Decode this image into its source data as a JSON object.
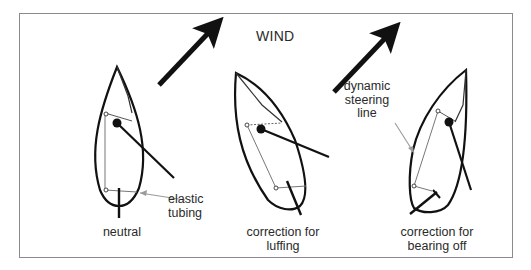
{
  "title": "WIND",
  "colors": {
    "stroke": "#111111",
    "thin_line": "#666666",
    "pointer": "#9a9a9a",
    "frame": "#8a8a8a",
    "text": "#2a2a2a"
  },
  "icons": {
    "wind_arrows": [
      "wind-arrow-icon",
      "wind-arrow-icon"
    ]
  },
  "panels": [
    {
      "id": "neutral",
      "caption": [
        "neutral"
      ],
      "callout": [
        "elastic",
        "tubing"
      ]
    },
    {
      "id": "luffing",
      "caption": [
        "correction for",
        "luffing"
      ]
    },
    {
      "id": "bearing-off",
      "caption": [
        "correction for",
        "bearing off"
      ],
      "callout": [
        "dynamic",
        "steering",
        "line"
      ]
    }
  ]
}
